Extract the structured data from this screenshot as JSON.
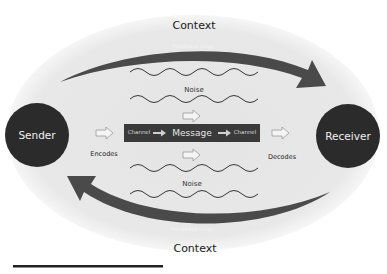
{
  "diagram": {
    "context_top": "Context",
    "context_bottom": "Context",
    "feedback_top": "Feedback Loop",
    "feedback_bottom": "Feedback Loop",
    "noise_top": "Noise",
    "noise_bottom": "Noise",
    "sender": "Sender",
    "receiver": "Receiver",
    "encodes": "Encodes",
    "decodes": "Decodes",
    "channel_left": "Channel",
    "message": "Message",
    "channel_right": "Channel"
  },
  "colors": {
    "ellipse": "#e6e6e6",
    "node": "#2b2b2b",
    "arrow": "#4a4a4a",
    "channel_bar": "#3a3a3a"
  }
}
